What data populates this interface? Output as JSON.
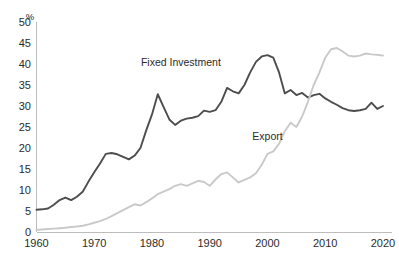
{
  "chart_data": {
    "type": "line",
    "title": "",
    "subtitle": "",
    "xlabel": "",
    "ylabel": "%",
    "yunit_label": "%",
    "xlim": [
      1960,
      2020
    ],
    "ylim": [
      0,
      50
    ],
    "grid": false,
    "legend_position": "inline-annotations",
    "xticks": [
      "1960",
      "1970",
      "1980",
      "1990",
      "2000",
      "2010",
      "2020"
    ],
    "xtick_values": [
      1960,
      1970,
      1980,
      1990,
      2000,
      2010,
      2020
    ],
    "yticks": [
      "0",
      "5",
      "10",
      "15",
      "20",
      "25",
      "30",
      "35",
      "40",
      "45",
      "50"
    ],
    "ytick_values": [
      0,
      5,
      10,
      15,
      20,
      25,
      30,
      35,
      40,
      45,
      50
    ],
    "x": [
      1960,
      1961,
      1962,
      1963,
      1964,
      1965,
      1966,
      1967,
      1968,
      1969,
      1970,
      1971,
      1972,
      1973,
      1974,
      1975,
      1976,
      1977,
      1978,
      1979,
      1980,
      1981,
      1982,
      1983,
      1984,
      1985,
      1986,
      1987,
      1988,
      1989,
      1990,
      1991,
      1992,
      1993,
      1994,
      1995,
      1996,
      1997,
      1998,
      1999,
      2000,
      2001,
      2002,
      2003,
      2004,
      2005,
      2006,
      2007,
      2008,
      2009,
      2010,
      2011,
      2012,
      2013,
      2014,
      2015,
      2016,
      2017,
      2018,
      2019,
      2020
    ],
    "series": [
      {
        "name": "Fixed Investment",
        "color": "#4d4d4d",
        "label_x": 1985,
        "label_y": 39.5,
        "values": [
          5.3,
          5.4,
          5.6,
          6.5,
          7.6,
          8.2,
          7.6,
          8.4,
          9.6,
          12.0,
          14.2,
          16.3,
          18.6,
          18.8,
          18.5,
          17.9,
          17.3,
          18.2,
          20.0,
          24.2,
          28.0,
          32.8,
          29.8,
          26.8,
          25.5,
          26.5,
          27.0,
          27.2,
          27.6,
          28.9,
          28.6,
          29.0,
          31.0,
          34.3,
          33.5,
          33.0,
          35.0,
          38.0,
          40.5,
          41.8,
          42.1,
          41.5,
          38.0,
          33.0,
          33.8,
          32.6,
          33.1,
          32.0,
          32.6,
          32.9,
          31.8,
          31.0,
          30.3,
          29.5,
          29.0,
          28.8,
          29.0,
          29.3,
          30.8,
          29.3,
          30.0
        ]
      },
      {
        "name": "Export",
        "color": "#c9c9c9",
        "label_x": 2000,
        "label_y": 22.0,
        "values": [
          0.5,
          0.6,
          0.7,
          0.8,
          0.9,
          1.0,
          1.2,
          1.3,
          1.5,
          1.8,
          2.2,
          2.6,
          3.1,
          3.8,
          4.5,
          5.2,
          5.9,
          6.6,
          6.3,
          7.1,
          8.0,
          9.0,
          9.6,
          10.2,
          11.0,
          11.4,
          11.0,
          11.6,
          12.2,
          11.9,
          11.0,
          12.5,
          13.8,
          14.2,
          13.0,
          11.8,
          12.4,
          13.0,
          14.0,
          16.0,
          18.6,
          19.2,
          21.0,
          24.0,
          26.0,
          25.0,
          27.5,
          31.0,
          35.0,
          38.0,
          41.5,
          43.5,
          43.8,
          43.0,
          42.0,
          41.8,
          42.0,
          42.5,
          42.3,
          42.2,
          42.0
        ]
      }
    ]
  }
}
